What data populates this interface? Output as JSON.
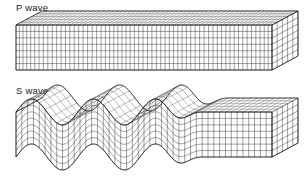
{
  "figure": {
    "background_color": "#ffffff",
    "line_color": "#2b2b2b",
    "width": 304,
    "height": 183
  },
  "panels": [
    {
      "id": "p-wave",
      "label": "P wave",
      "label_position": {
        "x": 16,
        "y": 2
      },
      "wave_type": "compressional",
      "description": "Undeformed rectangular block grid showing alternating compression and dilatation bands"
    },
    {
      "id": "s-wave",
      "label": "S wave",
      "label_position": {
        "x": 16,
        "y": 85
      },
      "wave_type": "shear",
      "description": "Block grid sheared into a transverse sinusoidal waveform on the left, undisturbed on the right"
    }
  ],
  "chart_data": {
    "type": "line",
    "xlabel": "",
    "ylabel": "",
    "panels": [
      {
        "name": "P wave",
        "kind": "compression-bands",
        "block": {
          "origin_x": 16,
          "origin_y": 25,
          "length": 256,
          "height": 45,
          "depth_x": 26,
          "depth_y": -14,
          "columns": 60,
          "rows": 7,
          "depth_rows": 5
        },
        "band_centers": [
          0.12,
          0.3,
          0.52,
          0.72,
          0.92
        ],
        "band_amplitude": 0.55,
        "band_count": 5
      },
      {
        "name": "S wave",
        "kind": "transverse-sine",
        "block": {
          "origin_x": 16,
          "origin_y": 112,
          "length": 256,
          "height": 45,
          "depth_x": 26,
          "depth_y": -14,
          "columns": 44,
          "rows": 7,
          "depth_rows": 5
        },
        "wave": {
          "amplitude": 13,
          "wavelength": 62,
          "phase": 0.0,
          "decay_start": 0.56,
          "decay_end": 0.74,
          "cycles_visible": 2.5
        }
      }
    ],
    "grid": true,
    "legend": "none"
  }
}
